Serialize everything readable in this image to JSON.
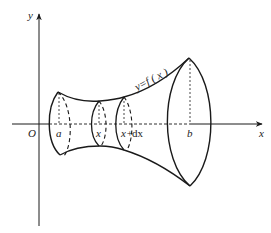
{
  "diagram": {
    "axes": {
      "x_label": "x",
      "y_label": "y",
      "origin_label": "O"
    },
    "curve_label": "y=f ( x )",
    "points": {
      "a": "a",
      "x": "x",
      "x_plus_dx_prefix": "x+",
      "dx": "dx",
      "b": "b"
    },
    "colors": {
      "stroke": "#1a1a1a",
      "background": "#ffffff"
    }
  }
}
